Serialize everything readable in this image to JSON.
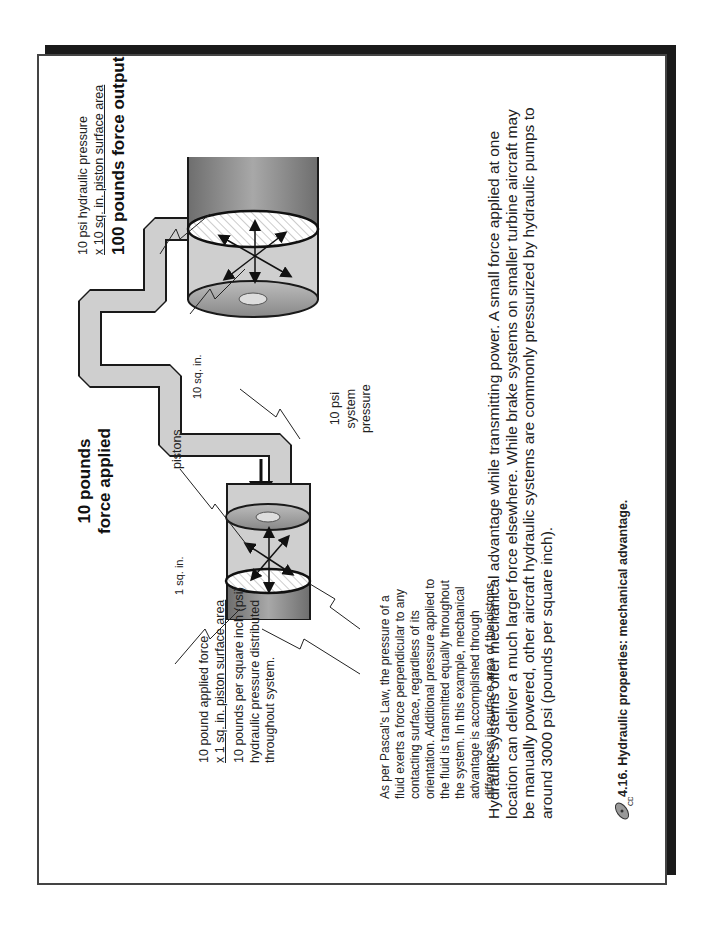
{
  "figure": {
    "input_side": {
      "force_label_line1": "10 pounds",
      "force_label_line2": "force applied",
      "piston_area_label": "1 sq. in.",
      "calc_line1": "10 pound applied force",
      "calc_line2": "x 1 sq. in. piston surface area",
      "result_line1": "10 pounds per square inch (psi)",
      "result_line2": "hydraulic pressure distributed",
      "result_line3": "throughout system."
    },
    "output_side": {
      "calc_line1": "10 psi hydraulic pressure",
      "calc_line2": "x 10 sq. in. piston surface area",
      "result": "100 pounds force output",
      "piston_area_label": "10 sq. in."
    },
    "pistons_label": "pistons",
    "system_pressure_line1": "10 psi",
    "system_pressure_line2": "system",
    "system_pressure_line3": "pressure",
    "pascal_note": [
      "As per Pascal's Law, the pressure of a",
      "fluid exerts a force perpendicular to any",
      "contacting surface, regardless of its",
      "orientation. Additional pressure applied to",
      "the fluid is transmitted equally throughout",
      "the system. In this example, mechanical",
      "advantage is accomplished through",
      "differences in surface area of the pistons."
    ],
    "icons": [
      "force-arrow-icon",
      "pressure-arrows-icon",
      "flow-arrow-icon",
      "cd-icon"
    ]
  },
  "body_text": "Hydraulic systems offer mechanical advantage while transmitting power.  A small force applied at one location can deliver a much larger force elsewhere.  While brake systems on smaller turbine aircraft may be manually powered, other aircraft hydraulic systems are commonly pressurized by hydraulic pumps to around 3000 psi (pounds per square inch).",
  "caption": {
    "icon_label": "CD",
    "text": "4.16.  Hydraulic properties: mechanical advantage."
  },
  "colors": {
    "fluid": "#cfcfcf",
    "cylinder_dark": "#8a8a8a",
    "outline": "#1a1a1a",
    "shadow": "#1a1a1a"
  }
}
